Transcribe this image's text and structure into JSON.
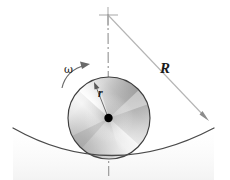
{
  "figure": {
    "background_color": "#ffffff",
    "width": 230,
    "height": 180
  },
  "labels": {
    "radius_big": "R",
    "radius_small": "r",
    "angular_velocity": "ω"
  },
  "colors": {
    "stroke": "#3a3a3a",
    "line_light": "#b9b9b9",
    "center_dot": "#000000",
    "disk_light": "#ffffff",
    "disk_mid": "#d2d2d2",
    "disk_dark": "#8f8f8f"
  },
  "geometry": {
    "pivot_x": 108,
    "pivot_y": 15,
    "disk_center_x": 109,
    "disk_center_y": 118,
    "disk_radius": 41,
    "bowl_left_x": 13,
    "bowl_right_x": 214,
    "bowl_edge_y": 128,
    "bowl_bottom_y": 160,
    "big_radius_end_x": 209,
    "big_radius_end_y": 121
  },
  "elements": {
    "pivot_mark": "cross-tick-mark",
    "center_line": "dash-dot-vertical-axis",
    "big_radius_line": "R-dimension-line-with-arrow",
    "small_radius_line": "r-dimension-line-with-arrow",
    "omega_arrow": "curved-counterclockwise-rotation-arrow",
    "disk": "shaded-metallic-disk",
    "bowl": "concave-surface-arc",
    "center_dot": "disk-center-point"
  }
}
